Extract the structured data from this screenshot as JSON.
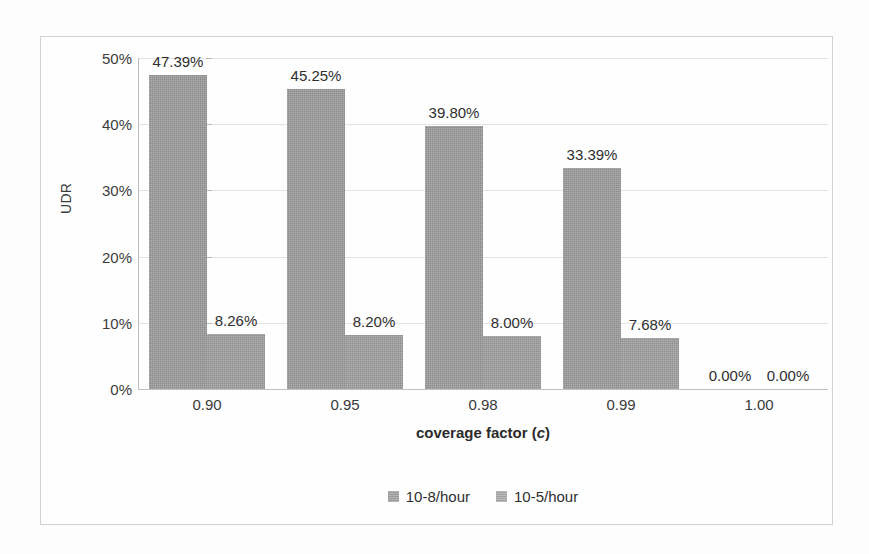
{
  "chart_data": {
    "type": "bar",
    "title": "",
    "xlabel": "coverage factor (c)",
    "xlabel_plain": "coverage factor",
    "xlabel_italic_symbol": "c",
    "ylabel": "UDR",
    "categories": [
      "0.90",
      "0.95",
      "0.98",
      "0.99",
      "1.00"
    ],
    "series": [
      {
        "name": "10-8/hour",
        "values": [
          47.39,
          45.25,
          39.8,
          33.39,
          0.0
        ],
        "labels": [
          "47.39%",
          "45.25%",
          "39.80%",
          "33.39%",
          "0.00%"
        ],
        "color": "#9b9b9b"
      },
      {
        "name": "10-5/hour",
        "values": [
          8.26,
          8.2,
          8.0,
          7.68,
          0.0
        ],
        "labels": [
          "8.26%",
          "8.20%",
          "8.00%",
          "7.68%",
          "0.00%"
        ],
        "color": "#a0a0a0"
      }
    ],
    "ylim": [
      0,
      50
    ],
    "yticks": [
      0,
      10,
      20,
      30,
      40,
      50
    ],
    "ytick_labels": [
      "0%",
      "10%",
      "20%",
      "30%",
      "40%",
      "50%"
    ],
    "grid": true,
    "legend_position": "bottom-center",
    "value_labels_shown": true
  },
  "legend": {
    "items": [
      {
        "label": "10-8/hour"
      },
      {
        "label": "10-5/hour"
      }
    ]
  }
}
